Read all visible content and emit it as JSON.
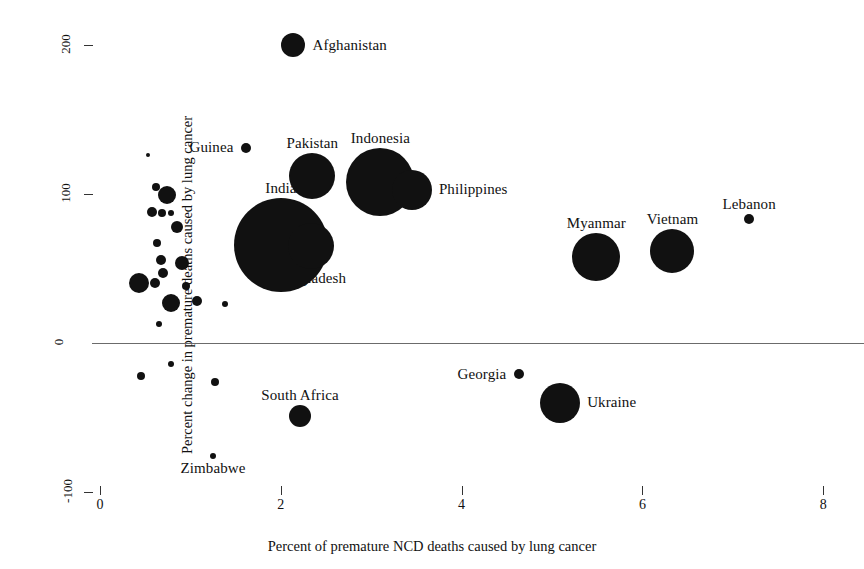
{
  "chart_data": {
    "type": "scatter",
    "title": "",
    "xlabel": "Percent of premature NCD deaths caused by lung cancer",
    "ylabel": "Percent change in premature deaths caused by lung cancer",
    "xlim": [
      0,
      8
    ],
    "ylim": [
      -100,
      200
    ],
    "xticks": [
      0,
      2,
      4,
      6,
      8
    ],
    "yticks": [
      -100,
      0,
      100,
      200
    ],
    "xtick_labels": [
      "0",
      "2",
      "4",
      "6",
      "8"
    ],
    "ytick_labels": [
      "-100",
      "0",
      "100",
      "200"
    ],
    "grid": false,
    "legend": "none",
    "reference_lines": [
      {
        "axis": "y",
        "value": 0,
        "color": "#6b6b6b"
      }
    ],
    "size_encoding": "bubble area proportional to number of premature lung cancer deaths",
    "points": [
      {
        "label": "Afghanistan",
        "x": 2.14,
        "y": 200,
        "r": 12,
        "label_pos": "right"
      },
      {
        "label": "Guinea",
        "x": 1.61,
        "y": 131,
        "r": 5,
        "label_pos": "left"
      },
      {
        "label": "Pakistan",
        "x": 2.35,
        "y": 112,
        "r": 23,
        "label_pos": "top"
      },
      {
        "label": "Indonesia",
        "x": 3.1,
        "y": 108,
        "r": 34,
        "label_pos": "top"
      },
      {
        "label": "Philippines",
        "x": 3.45,
        "y": 103,
        "r": 20,
        "label_pos": "right"
      },
      {
        "label": "India",
        "x": 2.0,
        "y": 66,
        "r": 47,
        "label_pos": "top"
      },
      {
        "label": "Bangladesh",
        "x": 2.33,
        "y": 65,
        "r": 23,
        "label_pos": "bottom"
      },
      {
        "label": "Myanmar",
        "x": 5.49,
        "y": 58,
        "r": 24,
        "label_pos": "top"
      },
      {
        "label": "Vietnam",
        "x": 6.33,
        "y": 62,
        "r": 22,
        "label_pos": "top"
      },
      {
        "label": "Lebanon",
        "x": 7.18,
        "y": 83,
        "r": 5,
        "label_pos": "top"
      },
      {
        "label": "Georgia",
        "x": 4.63,
        "y": -21,
        "r": 5,
        "label_pos": "left"
      },
      {
        "label": "Ukraine",
        "x": 5.09,
        "y": -40,
        "r": 20,
        "label_pos": "right"
      },
      {
        "label": "South Africa",
        "x": 2.21,
        "y": -49,
        "r": 11,
        "label_pos": "top"
      },
      {
        "label": "Zimbabwe",
        "x": 1.25,
        "y": -76,
        "r": 3,
        "label_pos": "bottom"
      },
      {
        "label": "",
        "x": 0.53,
        "y": 126,
        "r": 2,
        "label_pos": "none"
      },
      {
        "label": "",
        "x": 0.62,
        "y": 105,
        "r": 4,
        "label_pos": "none"
      },
      {
        "label": "",
        "x": 0.74,
        "y": 99,
        "r": 9,
        "label_pos": "none"
      },
      {
        "label": "",
        "x": 0.57,
        "y": 88,
        "r": 5,
        "label_pos": "none"
      },
      {
        "label": "",
        "x": 0.69,
        "y": 87,
        "r": 4,
        "label_pos": "none"
      },
      {
        "label": "",
        "x": 0.79,
        "y": 87,
        "r": 3,
        "label_pos": "none"
      },
      {
        "label": "",
        "x": 0.85,
        "y": 78,
        "r": 6,
        "label_pos": "none"
      },
      {
        "label": "",
        "x": 0.63,
        "y": 67,
        "r": 4,
        "label_pos": "none"
      },
      {
        "label": "",
        "x": 0.68,
        "y": 56,
        "r": 5,
        "label_pos": "none"
      },
      {
        "label": "",
        "x": 0.91,
        "y": 54,
        "r": 7,
        "label_pos": "none"
      },
      {
        "label": "",
        "x": 0.7,
        "y": 47,
        "r": 5,
        "label_pos": "none"
      },
      {
        "label": "",
        "x": 0.43,
        "y": 40,
        "r": 10,
        "label_pos": "none"
      },
      {
        "label": "",
        "x": 0.61,
        "y": 40,
        "r": 5,
        "label_pos": "none"
      },
      {
        "label": "",
        "x": 0.95,
        "y": 38,
        "r": 4,
        "label_pos": "none"
      },
      {
        "label": "",
        "x": 0.78,
        "y": 27,
        "r": 9,
        "label_pos": "none"
      },
      {
        "label": "",
        "x": 1.07,
        "y": 28,
        "r": 5,
        "label_pos": "none"
      },
      {
        "label": "",
        "x": 1.38,
        "y": 26,
        "r": 3,
        "label_pos": "none"
      },
      {
        "label": "",
        "x": 0.65,
        "y": 13,
        "r": 3,
        "label_pos": "none"
      },
      {
        "label": "",
        "x": 0.79,
        "y": -14,
        "r": 3,
        "label_pos": "none"
      },
      {
        "label": "",
        "x": 0.45,
        "y": -22,
        "r": 4,
        "label_pos": "none"
      },
      {
        "label": "",
        "x": 1.27,
        "y": -26,
        "r": 4,
        "label_pos": "none"
      }
    ]
  },
  "axes": {
    "y_title": "Percent change in premature deaths caused by lung cancer",
    "x_title": "Percent of premature NCD deaths caused by lung cancer"
  }
}
